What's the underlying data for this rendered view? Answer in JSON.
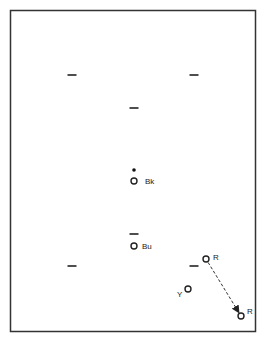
{
  "diagram": {
    "type": "color-position-plot",
    "frame": {
      "x": 10,
      "y": 10,
      "width": 246,
      "height": 322,
      "stroke": "#333333"
    },
    "markers": [
      {
        "id": "dash-1",
        "kind": "dash",
        "x": 72,
        "y": 75
      },
      {
        "id": "dash-2",
        "kind": "dash",
        "x": 194,
        "y": 75
      },
      {
        "id": "dash-3",
        "kind": "dash",
        "x": 134,
        "y": 108
      },
      {
        "id": "dash-4",
        "kind": "dash",
        "x": 134,
        "y": 234
      },
      {
        "id": "dash-5",
        "kind": "dash",
        "x": 72,
        "y": 266
      },
      {
        "id": "dash-6",
        "kind": "dash",
        "x": 194,
        "y": 266
      }
    ],
    "dot": {
      "x": 134,
      "y": 170
    },
    "points": [
      {
        "id": "bk",
        "label": "Bk",
        "x": 134,
        "y": 181,
        "label_x": 145,
        "label_y": 184
      },
      {
        "id": "bu",
        "label": "Bu",
        "x": 134,
        "y": 246,
        "label_x": 142,
        "label_y": 249
      },
      {
        "id": "r1",
        "label": "R",
        "x": 206,
        "y": 259,
        "label_x": 213,
        "label_y": 260
      },
      {
        "id": "y",
        "label": "Y",
        "x": 188,
        "y": 289,
        "label_x": 177,
        "label_y": 297
      },
      {
        "id": "r2",
        "label": "R",
        "x": 241,
        "y": 316,
        "label_x": 247,
        "label_y": 314
      }
    ],
    "arrow": {
      "from": "r1",
      "to": "r2",
      "style": "dashed"
    }
  }
}
